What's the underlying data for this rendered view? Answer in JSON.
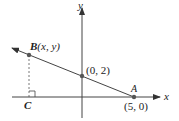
{
  "diagram": {
    "axes": {
      "x_label": "x",
      "y_label": "y"
    },
    "points": {
      "B": {
        "label": "B",
        "coords": "(x, y)"
      },
      "intercept_y": {
        "label": "(0, 2)"
      },
      "A": {
        "label": "A",
        "coords": "(5, 0)"
      },
      "C": {
        "label": "C"
      }
    },
    "colors": {
      "line": "#444444",
      "point": "#555555",
      "text": "#222222"
    }
  }
}
